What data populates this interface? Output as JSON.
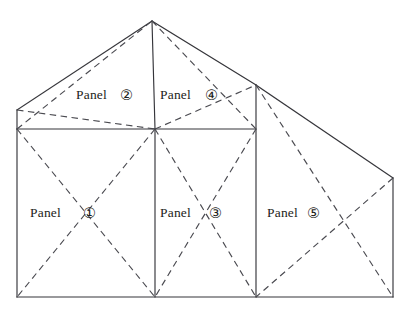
{
  "diagram": {
    "type": "line-diagram",
    "canvas": {
      "width": 410,
      "height": 314,
      "background": "#ffffff"
    },
    "style": {
      "solid_line_color": "#35353a",
      "dashed_line_color": "#4a4a50",
      "line_width": 1.15,
      "dash_pattern": "6.5 4.5"
    },
    "vertices": {
      "apex": [
        152,
        21
      ],
      "left_gable_top": [
        17,
        110
      ],
      "left_eave": [
        17,
        129
      ],
      "mid_eave": [
        155,
        129
      ],
      "right_eave_top": [
        256,
        85
      ],
      "right_eave": [
        256,
        129
      ],
      "far_right_top": [
        393,
        178
      ],
      "far_right_bottom": [
        393,
        297
      ],
      "left_bottom": [
        17,
        297
      ],
      "mid_bottom": [
        155,
        297
      ],
      "right_bottom": [
        256,
        297
      ]
    },
    "labels": [
      {
        "id": "panel-1",
        "text": "Panel",
        "number": "①",
        "number_plain": "1"
      },
      {
        "id": "panel-2",
        "text": "Panel",
        "number": "②",
        "number_plain": "2"
      },
      {
        "id": "panel-3",
        "text": "Panel",
        "number": "③",
        "number_plain": "3"
      },
      {
        "id": "panel-4",
        "text": "Panel",
        "number": "④",
        "number_plain": "4"
      },
      {
        "id": "panel-5",
        "text": "Panel",
        "number": "⑤",
        "number_plain": "5"
      }
    ],
    "solid_edges": [
      {
        "name": "left-roof-slope",
        "from": [
          17,
          110
        ],
        "to": [
          152,
          21
        ]
      },
      {
        "name": "right-roof-slope",
        "from": [
          152,
          21
        ],
        "to": [
          256,
          85
        ]
      },
      {
        "name": "right-lean-slope",
        "from": [
          256,
          85
        ],
        "to": [
          393,
          178
        ]
      },
      {
        "name": "ridge-vertical",
        "from": [
          152,
          21
        ],
        "to": [
          155,
          129
        ]
      },
      {
        "name": "left-gable-wall",
        "from": [
          17,
          110
        ],
        "to": [
          17,
          129
        ]
      },
      {
        "name": "eave-line",
        "from": [
          17,
          129
        ],
        "to": [
          256,
          129
        ]
      },
      {
        "name": "left-wall",
        "from": [
          17,
          129
        ],
        "to": [
          17,
          297
        ]
      },
      {
        "name": "mid-divider",
        "from": [
          155,
          129
        ],
        "to": [
          155,
          297
        ]
      },
      {
        "name": "right-divider",
        "from": [
          256,
          85
        ],
        "to": [
          256,
          297
        ]
      },
      {
        "name": "far-right-wall",
        "from": [
          393,
          178
        ],
        "to": [
          393,
          297
        ]
      },
      {
        "name": "bottom-line",
        "from": [
          17,
          297
        ],
        "to": [
          393,
          297
        ]
      }
    ],
    "dashed_edges": [
      {
        "name": "panel2-diag-a",
        "from": [
          17,
          129
        ],
        "to": [
          152,
          21
        ]
      },
      {
        "name": "panel2-diag-b",
        "from": [
          17,
          110
        ],
        "to": [
          155,
          129
        ]
      },
      {
        "name": "panel4-diag-a",
        "from": [
          155,
          129
        ],
        "to": [
          256,
          85
        ]
      },
      {
        "name": "panel4-diag-b",
        "from": [
          152,
          21
        ],
        "to": [
          256,
          129
        ]
      },
      {
        "name": "panel1-diag-a",
        "from": [
          17,
          129
        ],
        "to": [
          155,
          297
        ]
      },
      {
        "name": "panel1-diag-b",
        "from": [
          155,
          129
        ],
        "to": [
          17,
          297
        ]
      },
      {
        "name": "panel3-diag-a",
        "from": [
          155,
          129
        ],
        "to": [
          256,
          297
        ]
      },
      {
        "name": "panel3-diag-b",
        "from": [
          256,
          129
        ],
        "to": [
          155,
          297
        ]
      },
      {
        "name": "panel5-diag-a",
        "from": [
          256,
          85
        ],
        "to": [
          393,
          297
        ]
      },
      {
        "name": "panel5-diag-b",
        "from": [
          393,
          178
        ],
        "to": [
          256,
          297
        ]
      }
    ],
    "panels": [
      {
        "id": "panel-1",
        "shape": "rectangle",
        "corners": [
          [
            17,
            129
          ],
          [
            155,
            129
          ],
          [
            155,
            297
          ],
          [
            17,
            297
          ]
        ]
      },
      {
        "id": "panel-2",
        "shape": "triangle",
        "corners": [
          [
            17,
            110
          ],
          [
            152,
            21
          ],
          [
            155,
            129
          ],
          [
            17,
            129
          ]
        ]
      },
      {
        "id": "panel-3",
        "shape": "rectangle",
        "corners": [
          [
            155,
            129
          ],
          [
            256,
            129
          ],
          [
            256,
            297
          ],
          [
            155,
            297
          ]
        ]
      },
      {
        "id": "panel-4",
        "shape": "triangle",
        "corners": [
          [
            152,
            21
          ],
          [
            256,
            85
          ],
          [
            256,
            129
          ],
          [
            155,
            129
          ]
        ]
      },
      {
        "id": "panel-5",
        "shape": "quadrilateral",
        "corners": [
          [
            256,
            85
          ],
          [
            393,
            178
          ],
          [
            393,
            297
          ],
          [
            256,
            297
          ]
        ]
      }
    ]
  }
}
